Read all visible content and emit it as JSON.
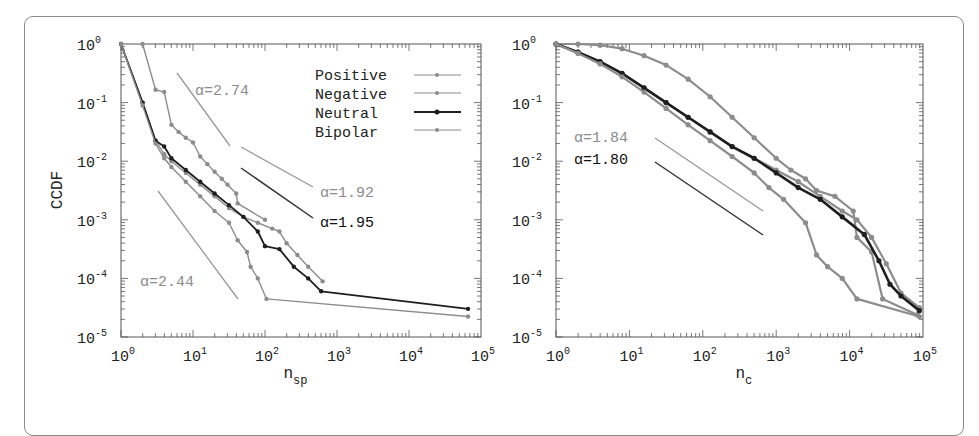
{
  "chart_data": [
    {
      "type": "line",
      "panel": "left",
      "title": "",
      "xlabel": "n_sp",
      "ylabel": "CCDF",
      "xscale": "log",
      "yscale": "log",
      "xlim": [
        1,
        100000
      ],
      "ylim": [
        1e-05,
        1
      ],
      "x_tick_labels": [
        "10^0",
        "10^1",
        "10^2",
        "10^3",
        "10^4",
        "10^5"
      ],
      "y_tick_labels": [
        "10^0",
        "10^-1",
        "10^-2",
        "10^-3",
        "10^-4",
        "10^-5"
      ],
      "grid": false,
      "legend_position": "upper right",
      "legend": [
        "Positive",
        "Negative",
        "Neutral",
        "Bipolar"
      ],
      "series_log10": [
        {
          "name": "Positive",
          "color": "#8c8c8c",
          "width": 1.4,
          "points": [
            [
              0.3,
              0
            ],
            [
              0.48,
              -0.78
            ],
            [
              0.6,
              -0.82
            ],
            [
              0.7,
              -1.38
            ],
            [
              0.8,
              -1.5
            ],
            [
              0.9,
              -1.6
            ],
            [
              1.0,
              -1.68
            ],
            [
              1.1,
              -1.92
            ],
            [
              1.2,
              -2.05
            ],
            [
              1.3,
              -2.18
            ],
            [
              1.4,
              -2.3
            ],
            [
              1.48,
              -2.4
            ],
            [
              1.6,
              -2.55
            ],
            [
              1.62,
              -2.72
            ],
            [
              2.0,
              -3.0
            ]
          ]
        },
        {
          "name": "Negative",
          "color": "#8c8c8c",
          "width": 1.4,
          "points": [
            [
              0,
              0
            ],
            [
              0.3,
              -1.0
            ],
            [
              0.48,
              -1.65
            ],
            [
              0.6,
              -1.88
            ],
            [
              0.7,
              -2.0
            ],
            [
              0.9,
              -2.2
            ],
            [
              1.1,
              -2.4
            ],
            [
              1.3,
              -2.6
            ],
            [
              1.5,
              -2.8
            ],
            [
              1.7,
              -2.95
            ],
            [
              1.9,
              -3.05
            ],
            [
              2.1,
              -3.15
            ],
            [
              2.2,
              -3.2
            ],
            [
              2.3,
              -3.4
            ],
            [
              2.45,
              -3.6
            ],
            [
              2.6,
              -3.8
            ],
            [
              2.8,
              -4.05
            ]
          ]
        },
        {
          "name": "Neutral",
          "color": "#1e1e1e",
          "width": 1.8,
          "points": [
            [
              0,
              0
            ],
            [
              0.3,
              -1.0
            ],
            [
              0.48,
              -1.65
            ],
            [
              0.6,
              -1.75
            ],
            [
              0.7,
              -1.95
            ],
            [
              0.9,
              -2.15
            ],
            [
              1.1,
              -2.35
            ],
            [
              1.3,
              -2.55
            ],
            [
              1.5,
              -2.75
            ],
            [
              1.7,
              -2.95
            ],
            [
              1.9,
              -3.2
            ],
            [
              2.0,
              -3.45
            ],
            [
              2.2,
              -3.5
            ],
            [
              2.4,
              -3.8
            ],
            [
              2.6,
              -4.0
            ],
            [
              2.78,
              -4.22
            ],
            [
              4.82,
              -4.52
            ]
          ]
        },
        {
          "name": "Bipolar",
          "color": "#8c8c8c",
          "width": 1.4,
          "points": [
            [
              0,
              0
            ],
            [
              0.3,
              -1.05
            ],
            [
              0.48,
              -1.7
            ],
            [
              0.6,
              -1.95
            ],
            [
              0.7,
              -2.1
            ],
            [
              0.9,
              -2.35
            ],
            [
              1.1,
              -2.6
            ],
            [
              1.3,
              -2.85
            ],
            [
              1.5,
              -3.05
            ],
            [
              1.62,
              -3.35
            ],
            [
              1.75,
              -3.55
            ],
            [
              1.8,
              -3.8
            ],
            [
              1.9,
              -4.0
            ],
            [
              2.02,
              -4.35
            ],
            [
              4.82,
              -4.65
            ]
          ]
        }
      ],
      "reference_lines": [
        {
          "label": "α=2.74",
          "alpha": 2.74,
          "color": "#999999"
        },
        {
          "label": "α=1.92",
          "alpha": 1.92,
          "color": "#999999"
        },
        {
          "label": "α=1.95",
          "alpha": 1.95,
          "color": "#333333"
        },
        {
          "label": "α=2.44",
          "alpha": 2.44,
          "color": "#999999"
        }
      ]
    },
    {
      "type": "line",
      "panel": "right",
      "title": "",
      "xlabel": "n_c",
      "ylabel": "",
      "xscale": "log",
      "yscale": "log",
      "xlim": [
        1,
        100000
      ],
      "ylim": [
        1e-05,
        1
      ],
      "x_tick_labels": [
        "10^0",
        "10^1",
        "10^2",
        "10^3",
        "10^4",
        "10^5"
      ],
      "y_tick_labels": [
        "10^0",
        "10^-1",
        "10^-2",
        "10^-3",
        "10^-4",
        "10^-5"
      ],
      "grid": false,
      "series_log10": [
        {
          "name": "Positive",
          "color": "#8c8c8c",
          "width": 2.2,
          "points": [
            [
              0,
              0
            ],
            [
              0.3,
              0
            ],
            [
              0.6,
              -0.02
            ],
            [
              0.9,
              -0.08
            ],
            [
              1.2,
              -0.2
            ],
            [
              1.5,
              -0.36
            ],
            [
              1.8,
              -0.6
            ],
            [
              2.1,
              -0.9
            ],
            [
              2.4,
              -1.25
            ],
            [
              2.7,
              -1.6
            ],
            [
              3.0,
              -1.95
            ],
            [
              3.2,
              -2.15
            ],
            [
              3.4,
              -2.3
            ],
            [
              3.55,
              -2.5
            ],
            [
              3.8,
              -2.6
            ],
            [
              4.05,
              -2.85
            ],
            [
              4.1,
              -3.3
            ],
            [
              4.3,
              -3.55
            ],
            [
              4.45,
              -4.35
            ],
            [
              4.92,
              -4.62
            ]
          ]
        },
        {
          "name": "Negative",
          "color": "#8c8c8c",
          "width": 2.2,
          "points": [
            [
              0,
              0
            ],
            [
              0.3,
              -0.14
            ],
            [
              0.6,
              -0.3
            ],
            [
              0.9,
              -0.5
            ],
            [
              1.2,
              -0.75
            ],
            [
              1.5,
              -1.0
            ],
            [
              1.8,
              -1.25
            ],
            [
              2.1,
              -1.5
            ],
            [
              2.4,
              -1.75
            ],
            [
              2.7,
              -1.95
            ],
            [
              3.0,
              -2.15
            ],
            [
              3.3,
              -2.35
            ],
            [
              3.6,
              -2.6
            ],
            [
              3.9,
              -2.85
            ],
            [
              4.1,
              -3.0
            ],
            [
              4.3,
              -3.3
            ],
            [
              4.5,
              -3.75
            ],
            [
              4.7,
              -4.25
            ],
            [
              4.95,
              -4.5
            ]
          ]
        },
        {
          "name": "Neutral",
          "color": "#1e1e1e",
          "width": 2.6,
          "points": [
            [
              0,
              0
            ],
            [
              0.3,
              -0.14
            ],
            [
              0.6,
              -0.3
            ],
            [
              0.9,
              -0.5
            ],
            [
              1.2,
              -0.75
            ],
            [
              1.5,
              -1.0
            ],
            [
              1.8,
              -1.25
            ],
            [
              2.1,
              -1.5
            ],
            [
              2.4,
              -1.75
            ],
            [
              2.7,
              -1.95
            ],
            [
              3.0,
              -2.2
            ],
            [
              3.3,
              -2.45
            ],
            [
              3.6,
              -2.65
            ],
            [
              3.9,
              -2.95
            ],
            [
              4.2,
              -3.25
            ],
            [
              4.4,
              -3.7
            ],
            [
              4.55,
              -4.1
            ],
            [
              4.7,
              -4.3
            ],
            [
              4.95,
              -4.55
            ]
          ]
        },
        {
          "name": "Bipolar",
          "color": "#8c8c8c",
          "width": 2.2,
          "points": [
            [
              0,
              0
            ],
            [
              0.3,
              -0.16
            ],
            [
              0.6,
              -0.34
            ],
            [
              0.9,
              -0.56
            ],
            [
              1.2,
              -0.82
            ],
            [
              1.5,
              -1.1
            ],
            [
              1.8,
              -1.38
            ],
            [
              2.1,
              -1.65
            ],
            [
              2.4,
              -1.92
            ],
            [
              2.7,
              -2.2
            ],
            [
              2.9,
              -2.45
            ],
            [
              3.1,
              -2.65
            ],
            [
              3.4,
              -3.05
            ],
            [
              3.55,
              -3.6
            ],
            [
              3.7,
              -3.8
            ],
            [
              3.9,
              -4.0
            ],
            [
              4.1,
              -4.35
            ],
            [
              4.95,
              -4.65
            ]
          ]
        }
      ],
      "reference_lines": [
        {
          "label": "α=1.84",
          "alpha": 1.84,
          "color": "#999999"
        },
        {
          "label": "α=1.80",
          "alpha": 1.8,
          "color": "#333333"
        }
      ]
    }
  ],
  "panels": {
    "left": {
      "ylabel": "CCDF",
      "xlabel_main": "n",
      "xlabel_sub": "sp",
      "legend": [
        {
          "label": "Positive",
          "color": "#8c8c8c"
        },
        {
          "label": "Negative",
          "color": "#8c8c8c"
        },
        {
          "label": "Neutral",
          "color": "#1e1e1e"
        },
        {
          "label": "Bipolar",
          "color": "#8c8c8c"
        }
      ],
      "annotations": [
        {
          "text": "α=2.74",
          "color": "#8c8c8c"
        },
        {
          "text": "α=1.92",
          "color": "#8c8c8c"
        },
        {
          "text": "α=1.95",
          "color": "#111111"
        },
        {
          "text": "α=2.44",
          "color": "#8c8c8c"
        }
      ]
    },
    "right": {
      "xlabel_main": "n",
      "xlabel_sub": "c",
      "annotations": [
        {
          "text": "α=1.84",
          "color": "#8c8c8c"
        },
        {
          "text": "α=1.80",
          "color": "#111111"
        }
      ]
    },
    "tick_base": "10",
    "x_exponents": [
      "0",
      "1",
      "2",
      "3",
      "4",
      "5"
    ],
    "y_exponents": [
      "0",
      "-1",
      "-2",
      "-3",
      "-4",
      "-5"
    ]
  }
}
